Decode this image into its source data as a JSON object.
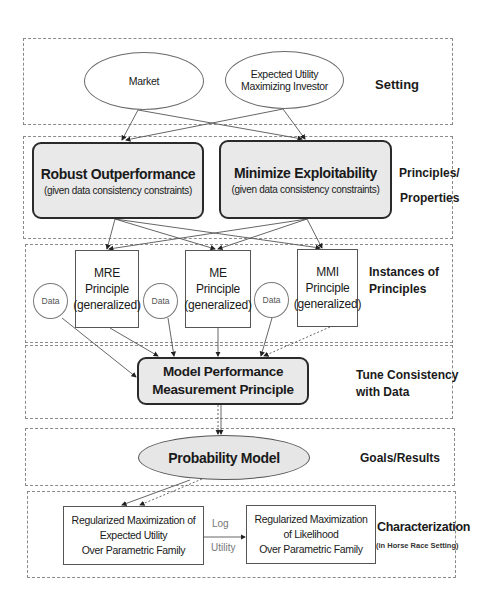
{
  "layers": [
    {
      "id": "setting",
      "label": "Setting"
    },
    {
      "id": "principles",
      "label_line1": "Principles/",
      "label_line2": "Properties"
    },
    {
      "id": "instances",
      "label_line1": "Instances of",
      "label_line2": "Principles"
    },
    {
      "id": "tune",
      "label_line1": "Tune Consistency",
      "label_line2": "with Data"
    },
    {
      "id": "goals",
      "label": "Goals/Results"
    },
    {
      "id": "characterization",
      "label": "Characterization",
      "sublabel": "(in Horse Race Setting)"
    }
  ],
  "setting": {
    "market": "Market",
    "investor_line1": "Expected Utility",
    "investor_line2": "Maximizing Investor"
  },
  "principles": {
    "robust_title": "Robust Outperformance",
    "robust_sub": "(given data consistency constraints)",
    "minimize_title": "Minimize Exploitability",
    "minimize_sub": "(given data consistency constraints)"
  },
  "instances": {
    "mre": [
      "MRE",
      "Principle",
      "(generalized)"
    ],
    "me": [
      "ME",
      "Principle",
      "(generalized)"
    ],
    "mmi": [
      "MMI",
      "Principle",
      "(generalized)"
    ],
    "data_label": "Data"
  },
  "tune": {
    "line1": "Model Performance",
    "line2": "Measurement Principle"
  },
  "goals": {
    "probability_model": "Probability Model"
  },
  "characterization": {
    "left": [
      "Regularized Maximization of",
      "Expected Utility",
      "Over Parametric Family"
    ],
    "right": [
      "Regularized Maximization",
      "of Likelihood",
      "Over Parametric Family"
    ],
    "arrow_top": "Log",
    "arrow_bottom": "Utility"
  },
  "colors": {
    "box_fill": "#e9e9e9",
    "border_dark": "#2a2a2a",
    "dashed_border": "#8a8a8a"
  }
}
